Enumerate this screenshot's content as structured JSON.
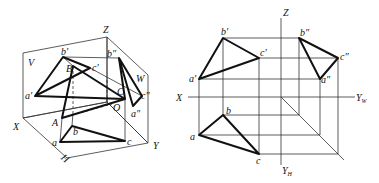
{
  "left_diagram": {
    "title": "Axonometric view of triangle ABC in three projection planes",
    "plane_labels": {
      "V": "V",
      "W": "W",
      "H": "H"
    },
    "axis_labels": {
      "X": "X",
      "Y": "Y",
      "Z": "Z",
      "O": "O"
    },
    "space_points": {
      "A": "A",
      "B": "B",
      "C": "C"
    },
    "front_view_points": {
      "a": "a'",
      "b": "b'",
      "c": "c'"
    },
    "side_view_points": {
      "a": "a\"",
      "b": "b\"",
      "c": "c\""
    },
    "top_view_points": {
      "a": "a",
      "b": "b",
      "c": "c"
    }
  },
  "right_diagram": {
    "title": "Orthographic three-view projection of triangle",
    "axis_labels": {
      "X": "X",
      "Z": "Z",
      "Y_W": "Y",
      "Y_W_sub": "W",
      "Y_H": "Y",
      "Y_H_sub": "H"
    },
    "front_view_points": {
      "a": "a'",
      "b": "b'",
      "c": "c'"
    },
    "side_view_points": {
      "a": "a\"",
      "b": "b\"",
      "c": "c\""
    },
    "top_view_points": {
      "a": "a",
      "b": "b",
      "c": "c"
    }
  }
}
